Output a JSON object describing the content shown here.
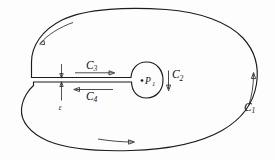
{
  "figure": {
    "title": "Contour integration diagram with slit and inner circle",
    "background_color": "#fdfdfd",
    "ink_color": "#1c1c1c",
    "labels": {
      "c1": {
        "base": "C",
        "sub": "1"
      },
      "c2": {
        "base": "C",
        "sub": "2"
      },
      "c3": {
        "base": "C",
        "sub": "3"
      },
      "c4": {
        "base": "C",
        "sub": "4"
      },
      "p1": {
        "base": "P",
        "sub": "1"
      },
      "epsilon": "ε"
    },
    "annotations": {
      "c1_description": "outer boundary contour, traversed counterclockwise",
      "c2_description": "small closed curve around the point P1, traversed clockwise",
      "c3_description": "upper edge of the slit, traversed to the right",
      "c4_description": "lower edge of the slit, traversed to the left",
      "epsilon_description": "width of the slit separating the upper and lower edges",
      "p1_description": "isolated singular point enclosed by C2"
    },
    "arrow_directions": {
      "outer_top_left": "left",
      "outer_bottom": "right",
      "outer_right": "up",
      "inner_c2": "down",
      "c3": "right",
      "c4": "left"
    }
  }
}
